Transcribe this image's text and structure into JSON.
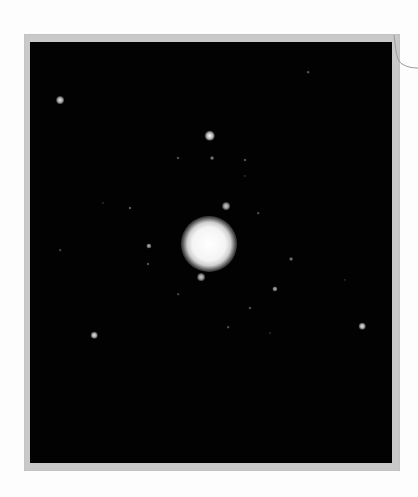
{
  "image": {
    "description": "Photographic print of a diffraction-like spot pattern: bright central spot surrounded by scattered point spots on black background, mounted in a light gray frame",
    "colors": {
      "paper": "#fdfdfd",
      "frame": "#c9c9c9",
      "plate": "#020202",
      "spot": "#ffffff"
    },
    "central_spot": {
      "x": 209,
      "y": 244,
      "core_radius": 16,
      "glow_radius": 28
    },
    "spots": [
      {
        "x": 210,
        "y": 136,
        "r": 4,
        "brightness": 1.0
      },
      {
        "x": 60,
        "y": 100,
        "r": 3,
        "brightness": 0.9
      },
      {
        "x": 226,
        "y": 206,
        "r": 3,
        "brightness": 0.8
      },
      {
        "x": 201,
        "y": 277,
        "r": 3,
        "brightness": 0.8
      },
      {
        "x": 94,
        "y": 335,
        "r": 2.5,
        "brightness": 0.9
      },
      {
        "x": 362,
        "y": 326,
        "r": 2.5,
        "brightness": 0.9
      },
      {
        "x": 149,
        "y": 246,
        "r": 2,
        "brightness": 0.7
      },
      {
        "x": 275,
        "y": 289,
        "r": 2,
        "brightness": 0.7
      },
      {
        "x": 291,
        "y": 259,
        "r": 1.5,
        "brightness": 0.5
      },
      {
        "x": 212,
        "y": 158,
        "r": 1.5,
        "brightness": 0.55
      },
      {
        "x": 178,
        "y": 158,
        "r": 1.2,
        "brightness": 0.4
      },
      {
        "x": 245,
        "y": 160,
        "r": 1.2,
        "brightness": 0.4
      },
      {
        "x": 130,
        "y": 208,
        "r": 1.2,
        "brightness": 0.45
      },
      {
        "x": 148,
        "y": 264,
        "r": 1.2,
        "brightness": 0.4
      },
      {
        "x": 308,
        "y": 72,
        "r": 1,
        "brightness": 0.4
      },
      {
        "x": 258,
        "y": 213,
        "r": 1,
        "brightness": 0.35
      },
      {
        "x": 250,
        "y": 308,
        "r": 1.2,
        "brightness": 0.4
      },
      {
        "x": 228,
        "y": 327,
        "r": 1,
        "brightness": 0.35
      },
      {
        "x": 60,
        "y": 250,
        "r": 1,
        "brightness": 0.3
      },
      {
        "x": 178,
        "y": 294,
        "r": 1,
        "brightness": 0.3
      },
      {
        "x": 270,
        "y": 333,
        "r": 0.8,
        "brightness": 0.3
      },
      {
        "x": 245,
        "y": 176,
        "r": 0.8,
        "brightness": 0.3
      },
      {
        "x": 103,
        "y": 203,
        "r": 0.8,
        "brightness": 0.3
      },
      {
        "x": 345,
        "y": 280,
        "r": 0.8,
        "brightness": 0.25
      }
    ]
  }
}
